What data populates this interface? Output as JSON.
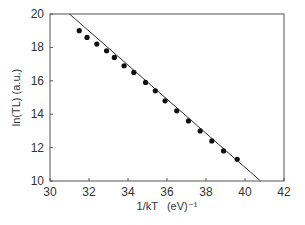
{
  "chart_data": {
    "type": "scatter",
    "title": "",
    "xlabel": "1/kT   (eV)⁻¹",
    "ylabel": "ln(TL) (a.u.)",
    "xlim": [
      30,
      42
    ],
    "ylim": [
      10,
      20
    ],
    "xticks": [
      30,
      32,
      34,
      36,
      38,
      40,
      42
    ],
    "yticks": [
      10,
      12,
      14,
      16,
      18,
      20
    ],
    "grid": false,
    "legend": null,
    "series": [
      {
        "name": "data",
        "style": "markers",
        "color": "#111111",
        "x": [
          31.5,
          31.9,
          32.4,
          32.9,
          33.3,
          33.8,
          34.3,
          34.9,
          35.4,
          35.9,
          36.5,
          37.1,
          37.7,
          38.3,
          38.9,
          39.6
        ],
        "y": [
          19.0,
          18.6,
          18.2,
          17.8,
          17.4,
          16.9,
          16.5,
          15.9,
          15.4,
          14.8,
          14.2,
          13.6,
          13.0,
          12.4,
          11.8,
          11.3
        ]
      },
      {
        "name": "linear fit",
        "style": "line",
        "color": "#333333",
        "x": [
          31.0,
          40.8
        ],
        "y": [
          20.0,
          10.0
        ]
      }
    ]
  }
}
